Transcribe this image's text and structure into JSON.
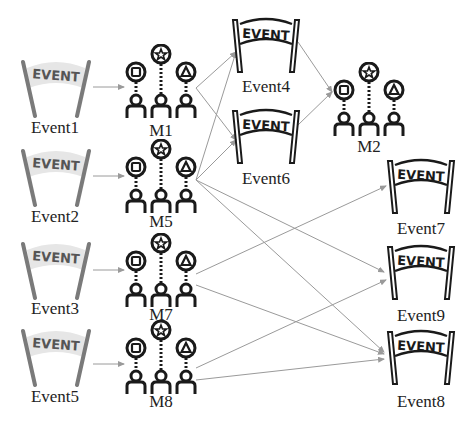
{
  "diagram": {
    "type": "event-mechanism-flow",
    "colors": {
      "edge": "#9a9a9a",
      "icon_outline": "#1a1a1a",
      "faded_banner_fill": "#e6e6e6",
      "faded_pole": "#7a7a7a",
      "label_text": "#222222"
    },
    "source_events": [
      {
        "id": "Event1",
        "label": "Event1",
        "style": "faded"
      },
      {
        "id": "Event2",
        "label": "Event2",
        "style": "faded"
      },
      {
        "id": "Event3",
        "label": "Event3",
        "style": "faded"
      },
      {
        "id": "Event5",
        "label": "Event5",
        "style": "faded"
      }
    ],
    "mechanisms": [
      {
        "id": "M1",
        "label": "M1"
      },
      {
        "id": "M5",
        "label": "M5"
      },
      {
        "id": "M7",
        "label": "M7"
      },
      {
        "id": "M8",
        "label": "M8"
      },
      {
        "id": "M2",
        "label": "M2"
      }
    ],
    "target_events": [
      {
        "id": "Event4",
        "label": "Event4",
        "style": "outline"
      },
      {
        "id": "Event6",
        "label": "Event6",
        "style": "outline"
      },
      {
        "id": "Event7",
        "label": "Event7",
        "style": "outline"
      },
      {
        "id": "Event9",
        "label": "Event9",
        "style": "outline"
      },
      {
        "id": "Event8",
        "label": "Event8",
        "style": "outline"
      }
    ],
    "banner_text": "EVENT",
    "mechanism_icon_symbols": [
      "square",
      "star",
      "triangle"
    ],
    "edges": [
      {
        "from": "Event1",
        "to": "M1"
      },
      {
        "from": "Event2",
        "to": "M5"
      },
      {
        "from": "Event3",
        "to": "M7"
      },
      {
        "from": "Event5",
        "to": "M8"
      },
      {
        "from": "M1",
        "to": "Event4"
      },
      {
        "from": "M1",
        "to": "Event6"
      },
      {
        "from": "M5",
        "to": "Event4"
      },
      {
        "from": "M5",
        "to": "Event6"
      },
      {
        "from": "M5",
        "to": "Event9"
      },
      {
        "from": "M5",
        "to": "Event8"
      },
      {
        "from": "M7",
        "to": "Event7"
      },
      {
        "from": "M7",
        "to": "Event8"
      },
      {
        "from": "M8",
        "to": "Event9"
      },
      {
        "from": "M8",
        "to": "Event8"
      },
      {
        "from": "Event4",
        "to": "M2"
      },
      {
        "from": "Event6",
        "to": "M2"
      }
    ]
  }
}
